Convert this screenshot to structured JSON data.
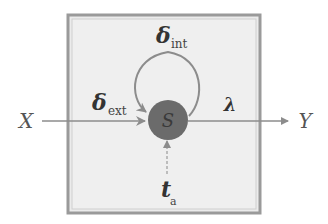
{
  "diagram": {
    "type": "DEVS atomic model",
    "input_label": "X",
    "output_label": "Y",
    "state_label": "S",
    "external_transition": {
      "symbol": "δ",
      "subscript": "ext"
    },
    "internal_transition": {
      "symbol": "δ",
      "subscript": "int"
    },
    "output_function": {
      "symbol": "λ"
    },
    "time_advance": {
      "symbol": "t",
      "subscript": "a"
    },
    "colors": {
      "box_fill": "#ebebeb",
      "box_border": "#8a8a8a",
      "state_fill": "#6b6b6b",
      "arrow": "#8c8c8c",
      "text": "#555555"
    }
  }
}
